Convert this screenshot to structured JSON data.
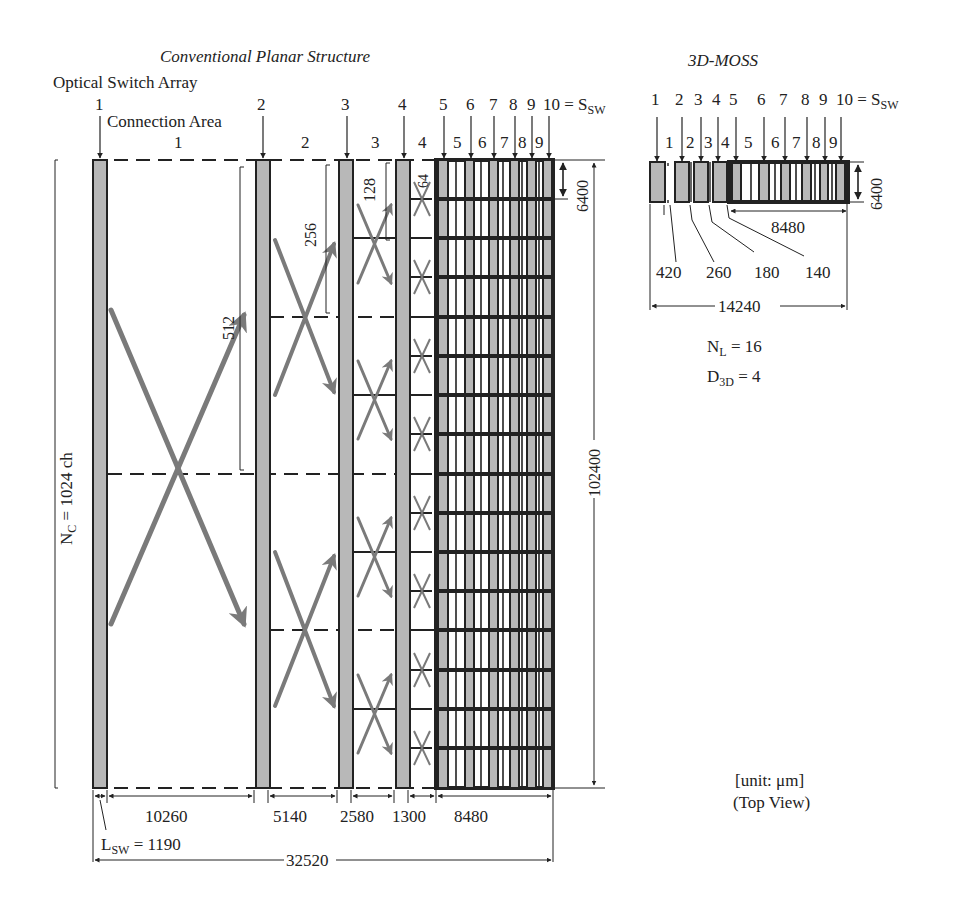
{
  "titles": {
    "conventional": "Conventional Planar Structure",
    "moss": "3D-MOSS"
  },
  "labels": {
    "optical_switch_array": "Optical Switch Array",
    "connection_area": "Connection Area",
    "s_sw_suffix": "10 = S",
    "s_sw_sub": "SW",
    "n_c_main": "N",
    "n_c_sub": "C",
    "n_c_value": " = 1024 ch",
    "l_sw_main": "L",
    "l_sw_sub": "SW",
    "l_sw_value": " = 1190",
    "n_l_main": "N",
    "n_l_sub": "L",
    "n_l_value": " = 16",
    "d_3d_main": "D",
    "d_3d_sub": "3D",
    "d_3d_value": " = 4",
    "unit": "[unit: μm]",
    "view": "(Top View)"
  },
  "conventional": {
    "switch_numbers": [
      "1",
      "2",
      "3",
      "4",
      "5",
      "6",
      "7",
      "8",
      "9"
    ],
    "connection_numbers": [
      "1",
      "2",
      "3",
      "4",
      "5",
      "6",
      "7",
      "8",
      "9"
    ],
    "span_labels": [
      "512",
      "256",
      "128",
      "64"
    ],
    "bottom_dims": [
      "10260",
      "5140",
      "2580",
      "1300",
      "8480"
    ],
    "total_width": "32520",
    "height_total": "102400",
    "height_block": "6400"
  },
  "moss": {
    "switch_numbers": [
      "1",
      "2",
      "3",
      "4",
      "5",
      "6",
      "7",
      "8",
      "9"
    ],
    "connection_numbers": [
      "1",
      "2",
      "3",
      "4",
      "5",
      "6",
      "7",
      "8",
      "9"
    ],
    "gap_dims": [
      "420",
      "260",
      "180",
      "140"
    ],
    "block_width": "8480",
    "total_width": "14240",
    "height": "6400"
  },
  "colors": {
    "switch_fill": "#b8b8b8",
    "stroke": "#222222",
    "arrow": "#7a7a7a"
  }
}
